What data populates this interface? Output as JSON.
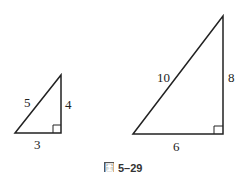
{
  "figure": {
    "caption_prefix": "圖",
    "caption_number": "5–29",
    "small_triangle": {
      "hypotenuse": "5",
      "vertical_leg": "4",
      "horizontal_leg": "3"
    },
    "large_triangle": {
      "hypotenuse": "10",
      "vertical_leg": "8",
      "horizontal_leg": "6"
    },
    "stroke_color": "#222222"
  }
}
